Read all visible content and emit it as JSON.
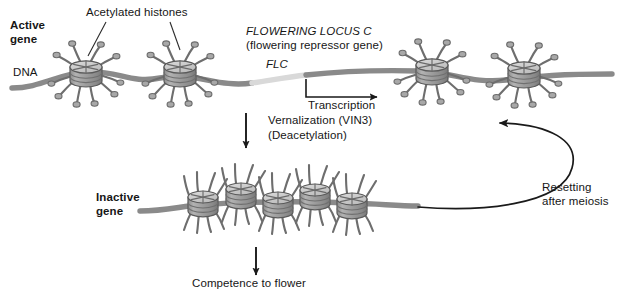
{
  "figure": {
    "background_color": "#ffffff",
    "width": 621,
    "height": 299
  },
  "colors": {
    "dna_strand": "#8a8a8a",
    "dna_flc_segment": "#d9d9d9",
    "nucleosome_body": "#9b9b9b",
    "nucleosome_top": "#cfcfcf",
    "nucleosome_outline": "#5a5a5a",
    "histone_tail": "#6e6e6e",
    "acetyl_knob": "#a8a8a8",
    "arrow": "#1a1a1a",
    "text": "#161616"
  },
  "labels": {
    "active_gene": "Active\ngene",
    "dna": "DNA",
    "acetylated_histones": "Acetylated histones",
    "flowering_locus_c": "FLOWERING LOCUS C",
    "flowering_repressor_gene": "(flowering repressor gene)",
    "flc": "FLC",
    "transcription": "Transcription",
    "vernalization": "Vernalization (VIN3)",
    "deacetylation": "(Deacetylation)",
    "inactive_gene": "Inactive\ngene",
    "competence_to_flower": "Competence to flower",
    "resetting_after_meiosis": "Resetting\nafter meiosis"
  },
  "diagram_data": {
    "type": "biology-schematic",
    "states": [
      {
        "name": "active-gene-state",
        "label": "Active gene",
        "chromatin": "open / extended",
        "histone_modification": "acetylated",
        "nucleosome_count": 4,
        "transcription": true
      },
      {
        "name": "inactive-gene-state",
        "label": "Inactive gene",
        "chromatin": "condensed / compacted",
        "histone_modification": "deacetylated",
        "nucleosome_count": 5,
        "transcription": false
      }
    ],
    "transitions": [
      {
        "name": "vernalization",
        "from": "active-gene-state",
        "to": "inactive-gene-state",
        "label": "Vernalization (VIN3) (Deacetylation)",
        "direction": "downward"
      },
      {
        "name": "competence",
        "from": "inactive-gene-state",
        "to": "flowering",
        "label": "Competence to flower",
        "direction": "downward"
      },
      {
        "name": "resetting",
        "from": "inactive-gene-state",
        "to": "active-gene-state",
        "label": "Resetting after meiosis",
        "direction": "curved-upward-right"
      },
      {
        "name": "transcription",
        "from": "flc-locus",
        "to": "downstream",
        "label": "Transcription",
        "direction": "rightward"
      }
    ],
    "gene": {
      "symbol": "FLC",
      "full_name": "FLOWERING LOCUS C",
      "description": "(flowering repressor gene)"
    }
  }
}
